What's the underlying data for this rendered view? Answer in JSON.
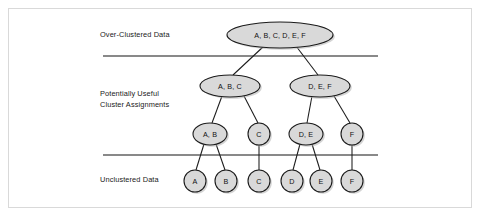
{
  "figure": {
    "type": "hierarchical-cluster-dendrogram",
    "background_color": "#ffffff",
    "border_color": "#d9d9d9",
    "node_fill_color": "#d9d9d9",
    "node_stroke_color": "#1b1b1b",
    "line_color": "#1b1b1b"
  },
  "band_labels": [
    {
      "id": "over-clustered",
      "text": "Over-Clustered Data",
      "lines": [
        "Over-Clustered Data"
      ],
      "x": 100,
      "y": 37
    },
    {
      "id": "potentially-useful",
      "text": "Potentially Useful Cluster Assignments",
      "lines": [
        "Potentially Useful",
        "Cluster Assignments"
      ],
      "x": 100,
      "y": 96
    },
    {
      "id": "unclustered",
      "text": "Unclustered Data",
      "lines": [
        "Unclustered Data"
      ],
      "x": 100,
      "y": 182
    }
  ],
  "dividers": [
    {
      "id": "divider-top",
      "x1": 103,
      "y1": 56,
      "x2": 378,
      "y2": 56
    },
    {
      "id": "divider-bottom",
      "x1": 103,
      "y1": 155,
      "x2": 378,
      "y2": 155
    }
  ],
  "nodes": [
    {
      "id": "root",
      "label": "A, B, C, D, E, F",
      "shape": "ellipse",
      "cx": 280,
      "cy": 35,
      "rx": 53,
      "ry": 13,
      "level": 1
    },
    {
      "id": "abc",
      "label": "A, B, C",
      "shape": "ellipse",
      "cx": 230,
      "cy": 86,
      "rx": 30,
      "ry": 11,
      "level": 2
    },
    {
      "id": "def",
      "label": "D, E, F",
      "shape": "ellipse",
      "cx": 320,
      "cy": 86,
      "rx": 30,
      "ry": 11,
      "level": 2
    },
    {
      "id": "ab",
      "label": "A, B",
      "shape": "ellipse",
      "cx": 210,
      "cy": 134,
      "rx": 17,
      "ry": 11,
      "level": 3
    },
    {
      "id": "c3",
      "label": "C",
      "shape": "circle",
      "cx": 259,
      "cy": 134,
      "rx": 11,
      "ry": 11,
      "level": 3
    },
    {
      "id": "de",
      "label": "D, E",
      "shape": "ellipse",
      "cx": 306,
      "cy": 134,
      "rx": 17,
      "ry": 11,
      "level": 3
    },
    {
      "id": "f3",
      "label": "F",
      "shape": "circle",
      "cx": 352,
      "cy": 134,
      "rx": 11,
      "ry": 11,
      "level": 3
    },
    {
      "id": "a4",
      "label": "A",
      "shape": "circle",
      "cx": 195,
      "cy": 181,
      "rx": 11,
      "ry": 11,
      "level": 4
    },
    {
      "id": "b4",
      "label": "B",
      "shape": "circle",
      "cx": 226,
      "cy": 181,
      "rx": 11,
      "ry": 11,
      "level": 4
    },
    {
      "id": "c4",
      "label": "C",
      "shape": "circle",
      "cx": 259,
      "cy": 181,
      "rx": 11,
      "ry": 11,
      "level": 4
    },
    {
      "id": "d4",
      "label": "D",
      "shape": "circle",
      "cx": 292,
      "cy": 181,
      "rx": 11,
      "ry": 11,
      "level": 4
    },
    {
      "id": "e4",
      "label": "E",
      "shape": "circle",
      "cx": 321,
      "cy": 181,
      "rx": 11,
      "ry": 11,
      "level": 4
    },
    {
      "id": "f4",
      "label": "F",
      "shape": "circle",
      "cx": 352,
      "cy": 181,
      "rx": 11,
      "ry": 11,
      "level": 4
    }
  ],
  "edges": [
    {
      "id": "root-abc",
      "from": "root",
      "to": "abc",
      "x1": 264,
      "y1": 46,
      "x2": 233,
      "y2": 75
    },
    {
      "id": "root-def",
      "from": "root",
      "to": "def",
      "x1": 296,
      "y1": 46,
      "x2": 318,
      "y2": 75
    },
    {
      "id": "abc-ab",
      "from": "abc",
      "to": "ab",
      "x1": 222,
      "y1": 96,
      "x2": 212,
      "y2": 123
    },
    {
      "id": "abc-c3",
      "from": "abc",
      "to": "c3",
      "x1": 244,
      "y1": 96,
      "x2": 258,
      "y2": 123
    },
    {
      "id": "def-de",
      "from": "def",
      "to": "de",
      "x1": 312,
      "y1": 96,
      "x2": 307,
      "y2": 123
    },
    {
      "id": "def-f3",
      "from": "def",
      "to": "f3",
      "x1": 334,
      "y1": 96,
      "x2": 350,
      "y2": 123
    },
    {
      "id": "ab-a4",
      "from": "ab",
      "to": "a4",
      "x1": 204,
      "y1": 144,
      "x2": 196,
      "y2": 170
    },
    {
      "id": "ab-b4",
      "from": "ab",
      "to": "b4",
      "x1": 216,
      "y1": 144,
      "x2": 225,
      "y2": 170
    },
    {
      "id": "c3-c4",
      "from": "c3",
      "to": "c4",
      "x1": 259,
      "y1": 145,
      "x2": 259,
      "y2": 170
    },
    {
      "id": "de-d4",
      "from": "de",
      "to": "d4",
      "x1": 300,
      "y1": 144,
      "x2": 293,
      "y2": 170
    },
    {
      "id": "de-e4",
      "from": "de",
      "to": "e4",
      "x1": 312,
      "y1": 144,
      "x2": 320,
      "y2": 170
    },
    {
      "id": "f3-f4",
      "from": "f3",
      "to": "f4",
      "x1": 352,
      "y1": 145,
      "x2": 352,
      "y2": 170
    }
  ]
}
